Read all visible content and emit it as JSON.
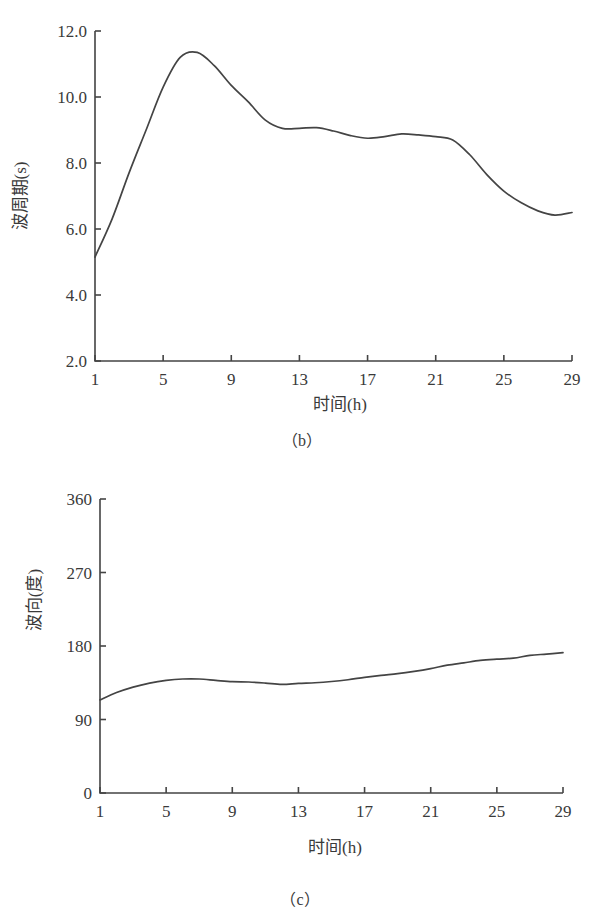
{
  "chart_data": [
    {
      "id": "b",
      "type": "line",
      "caption": "（b）",
      "title": "",
      "xlabel": "时间(h)",
      "ylabel": "波周期(s)",
      "xlim": [
        1,
        29
      ],
      "ylim": [
        2.0,
        12.0
      ],
      "xticks": [
        1,
        5,
        9,
        13,
        17,
        21,
        25,
        29
      ],
      "yticks": [
        "2.0",
        "4.0",
        "6.0",
        "8.0",
        "10.0",
        "12.0"
      ],
      "grid": false,
      "legend": null,
      "x": [
        1,
        2,
        3,
        4,
        5,
        6,
        7,
        8,
        9,
        10,
        11,
        12,
        13,
        14,
        15,
        16,
        17,
        18,
        19,
        20,
        21,
        22,
        23,
        24,
        25,
        26,
        27,
        28,
        29
      ],
      "series": [
        {
          "name": "波周期",
          "values": [
            5.15,
            6.3,
            7.7,
            9.0,
            10.3,
            11.2,
            11.35,
            10.95,
            10.35,
            9.85,
            9.3,
            9.05,
            9.05,
            9.07,
            8.97,
            8.83,
            8.75,
            8.8,
            8.88,
            8.85,
            8.8,
            8.7,
            8.25,
            7.65,
            7.15,
            6.8,
            6.55,
            6.42,
            6.5
          ]
        }
      ]
    },
    {
      "id": "c",
      "type": "line",
      "caption": "（c）",
      "title": "",
      "xlabel": "时间(h)",
      "ylabel": "波向(度)",
      "xlim": [
        1,
        29
      ],
      "ylim": [
        0,
        360
      ],
      "xticks": [
        1,
        5,
        9,
        13,
        17,
        21,
        25,
        29
      ],
      "yticks": [
        "0",
        "90",
        "180",
        "270",
        "360"
      ],
      "grid": false,
      "legend": null,
      "x": [
        1,
        2,
        3,
        4,
        5,
        6,
        7,
        8,
        9,
        10,
        11,
        12,
        13,
        14,
        15,
        16,
        17,
        18,
        19,
        20,
        21,
        22,
        23,
        24,
        25,
        26,
        27,
        28,
        29
      ],
      "series": [
        {
          "name": "波向",
          "values": [
            114,
            123,
            129.7,
            134.6,
            137.9,
            139.6,
            139.6,
            137.9,
            136.3,
            135.9,
            134.6,
            132.9,
            134.2,
            135,
            136.5,
            138.7,
            141.6,
            144.1,
            146.2,
            149,
            152.4,
            156.5,
            159.4,
            162.3,
            163.9,
            165.1,
            168.5,
            170.1,
            171.8
          ]
        }
      ]
    }
  ],
  "layout": {
    "charts": [
      {
        "plot": {
          "left": 95,
          "right": 572,
          "top": 31,
          "bottom": 361
        },
        "ylabel_x": 26,
        "ylabel_y": 196,
        "xlabel_x": 340,
        "xlabel_y": 410,
        "caption_x": 302,
        "caption_y": 446
      },
      {
        "plot": {
          "left": 100,
          "right": 563,
          "top": 499,
          "bottom": 793
        },
        "ylabel_x": 40,
        "ylabel_y": 600,
        "xlabel_x": 335,
        "xlabel_y": 853,
        "caption_x": 300,
        "caption_y": 905
      }
    ]
  }
}
